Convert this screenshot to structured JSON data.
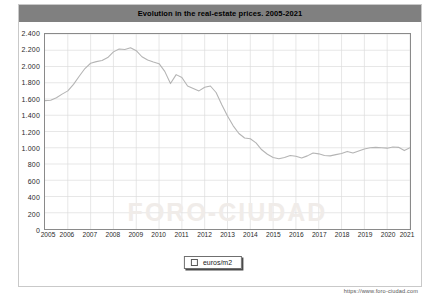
{
  "title": "Evolution in the real-estate prices. 2005-2021",
  "footer_url": "https://www.foro-ciudad.com",
  "watermark": "FORO-CIUDAD",
  "legend": {
    "label": "euros/m2",
    "swatch_color": "#ffffff"
  },
  "colors": {
    "title_bar": "#808080",
    "plot_border": "#8a8a8a",
    "grid": "#dcdcdc",
    "series_line": "#b4b4b4",
    "background": "#ffffff"
  },
  "chart_data": {
    "type": "line",
    "title": "Evolution in the real-estate prices. 2005-2021",
    "xlabel": "",
    "ylabel": "",
    "legend_position": "bottom",
    "grid": true,
    "xlim": [
      2005,
      2021
    ],
    "ylim": [
      0,
      2400
    ],
    "ytick_labels": [
      "0",
      "200",
      "400",
      "600",
      "800",
      "1.000",
      "1.200",
      "1.400",
      "1.600",
      "1.800",
      "2.000",
      "2.200",
      "2.400"
    ],
    "yticks": [
      0,
      200,
      400,
      600,
      800,
      1000,
      1200,
      1400,
      1600,
      1800,
      2000,
      2200,
      2400
    ],
    "xtick_labels": [
      "2005",
      "2006",
      "2007",
      "2008",
      "2009",
      "2010",
      "2011",
      "2012",
      "2013",
      "2014",
      "2015",
      "2016",
      "2017",
      "2018",
      "2019",
      "2020",
      "2021"
    ],
    "xticks": [
      2005,
      2006,
      2007,
      2008,
      2009,
      2010,
      2011,
      2012,
      2013,
      2014,
      2015,
      2016,
      2017,
      2018,
      2019,
      2020,
      2021
    ],
    "series": [
      {
        "name": "euros/m2",
        "x": [
          2005.0,
          2005.25,
          2005.5,
          2005.75,
          2006.0,
          2006.25,
          2006.5,
          2006.75,
          2007.0,
          2007.25,
          2007.5,
          2007.75,
          2008.0,
          2008.25,
          2008.5,
          2008.75,
          2009.0,
          2009.25,
          2009.5,
          2009.75,
          2010.0,
          2010.25,
          2010.5,
          2010.75,
          2011.0,
          2011.25,
          2011.5,
          2011.75,
          2012.0,
          2012.25,
          2012.5,
          2012.75,
          2013.0,
          2013.25,
          2013.5,
          2013.75,
          2014.0,
          2014.25,
          2014.5,
          2014.75,
          2015.0,
          2015.25,
          2015.5,
          2015.75,
          2016.0,
          2016.25,
          2016.5,
          2016.75,
          2017.0,
          2017.25,
          2017.5,
          2017.75,
          2018.0,
          2018.25,
          2018.5,
          2018.75,
          2019.0,
          2019.25,
          2019.5,
          2019.75,
          2020.0,
          2020.25,
          2020.5,
          2020.75,
          2021.0
        ],
        "values": [
          1580,
          1585,
          1615,
          1660,
          1700,
          1780,
          1880,
          1975,
          2040,
          2060,
          2075,
          2110,
          2180,
          2215,
          2210,
          2230,
          2195,
          2120,
          2080,
          2055,
          2035,
          1940,
          1790,
          1900,
          1865,
          1760,
          1730,
          1700,
          1745,
          1760,
          1680,
          1530,
          1390,
          1270,
          1175,
          1120,
          1110,
          1060,
          975,
          920,
          880,
          865,
          880,
          905,
          895,
          875,
          900,
          935,
          925,
          905,
          900,
          915,
          930,
          955,
          935,
          960,
          985,
          1000,
          1005,
          1000,
          995,
          1010,
          1005,
          965,
          1000
        ]
      }
    ]
  }
}
